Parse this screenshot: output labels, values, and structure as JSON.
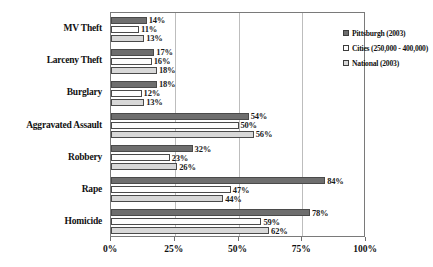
{
  "chart_data": {
    "type": "bar",
    "orientation": "horizontal",
    "title": "",
    "xlabel": "",
    "ylabel": "",
    "xlim": [
      0,
      100
    ],
    "xticks": [
      "0%",
      "25%",
      "50%",
      "75%",
      "100%"
    ],
    "xtick_values": [
      0,
      25,
      50,
      75,
      100
    ],
    "grid": "vertical",
    "legend_position": "top-right",
    "categories": [
      "MV Theft",
      "Larceny Theft",
      "Burglary",
      "Aggravated Assault",
      "Robbery",
      "Rape",
      "Homicide"
    ],
    "series": [
      {
        "name": "Pittsburgh (2003)",
        "color": "#6e6e6e",
        "values": [
          14,
          17,
          18,
          54,
          32,
          84,
          78
        ],
        "labels": [
          "14%",
          "17%",
          "18%",
          "54%",
          "32%",
          "84%",
          "78%"
        ]
      },
      {
        "name": "Cities (250,000 - 400,000)",
        "color": "#fdfdfd",
        "values": [
          11,
          16,
          12,
          50,
          23,
          47,
          59
        ],
        "labels": [
          "11%",
          "16%",
          "12%",
          "50%",
          "23%",
          "47%",
          "59%"
        ]
      },
      {
        "name": "National (2003)",
        "color": "#d8d8d8",
        "values": [
          13,
          18,
          13,
          56,
          26,
          44,
          62
        ],
        "labels": [
          "13%",
          "18%",
          "13%",
          "56%",
          "26%",
          "44%",
          "62%"
        ]
      }
    ]
  }
}
